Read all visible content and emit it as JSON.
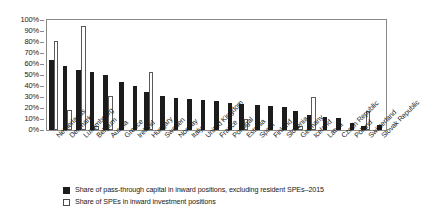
{
  "chart_data": {
    "type": "bar",
    "title": "",
    "xlabel": "",
    "ylabel": "",
    "ylim": [
      0,
      100
    ],
    "grid": false,
    "legend_position": "bottom-left",
    "ytick_labels": [
      "100%",
      "90%",
      "80%",
      "70%",
      "60%",
      "50%",
      "40%",
      "30%",
      "20%",
      "10%",
      "0%"
    ],
    "ytick_values": [
      100,
      90,
      80,
      70,
      60,
      50,
      40,
      30,
      20,
      10,
      0
    ],
    "categories": [
      "Netherlands",
      "Denmark",
      "Luxembourg",
      "Belgium",
      "Austria",
      "Greece",
      "Ireland",
      "Hungary",
      "Sweden",
      "Norway",
      "Italy",
      "United Kingdom",
      "France",
      "Portugal",
      "Estonia",
      "Spain",
      "Finland",
      "Slovenia",
      "Germany",
      "Iceland",
      "Latvia",
      "Czech Republic",
      "Poland",
      "Switzerland",
      "Slovak Republic"
    ],
    "series": [
      {
        "name": "Share of pass-through capital in inward positions, excluding resident SPEs–2015",
        "style": "dark",
        "values": [
          64,
          58,
          55,
          53,
          50,
          44,
          40,
          35,
          31,
          29,
          28,
          27,
          26,
          25,
          24,
          23,
          22,
          21,
          17,
          14,
          12,
          11,
          6,
          4,
          5
        ]
      },
      {
        "name": "Share of SPEs in inward investment positions",
        "style": "open",
        "values": [
          81,
          18,
          95,
          4,
          31,
          0,
          0,
          53,
          0,
          0,
          0,
          0,
          0,
          0,
          10,
          0,
          0,
          0,
          4,
          30,
          0,
          0,
          0,
          17,
          0
        ]
      }
    ],
    "legend": [
      {
        "label": "Share of pass-through capital in inward positions, excluding resident SPEs–2015",
        "style": "dark"
      },
      {
        "label": "Share of SPEs in inward investment positions",
        "style": "open"
      }
    ],
    "colors": {
      "dark_series": "#1c1c1c",
      "open_series_fill": "#ffffff",
      "open_series_edge": "#5a5a5a",
      "axis": "#8a8a8a",
      "text": "#1a1a1a",
      "background": "#ffffff"
    }
  }
}
